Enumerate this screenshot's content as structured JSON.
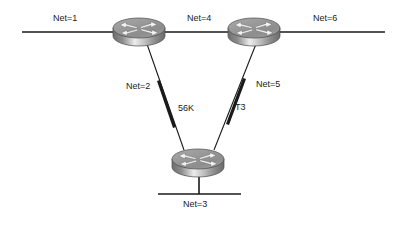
{
  "diagram": {
    "background_color": "#ffffff",
    "line_color": "#1a1a1a",
    "router_body_color": "#8e8e8e",
    "router_top_color": "#b5b5b5",
    "router_arrow_color": "#f2f2f2",
    "nodes": [
      {
        "id": "router-top-left",
        "name": "router-top-left",
        "icon": "router-icon",
        "x": 139,
        "y": 31
      },
      {
        "id": "router-top-right",
        "name": "router-top-right",
        "icon": "router-icon",
        "x": 254,
        "y": 31
      },
      {
        "id": "router-bottom",
        "name": "router-bottom",
        "icon": "router-icon",
        "x": 198,
        "y": 162
      }
    ],
    "links": [
      {
        "id": "link-net1",
        "name": "segment-net-1",
        "type": "bus",
        "label": "Net=1"
      },
      {
        "id": "link-net4",
        "name": "segment-net-4",
        "type": "bus",
        "label": "Net=4"
      },
      {
        "id": "link-net6",
        "name": "segment-net-6",
        "type": "bus",
        "label": "Net=6"
      },
      {
        "id": "link-net2",
        "name": "serial-link-net-2",
        "type": "serial",
        "label": "Net=2",
        "speed": "56K"
      },
      {
        "id": "link-net5",
        "name": "serial-link-net-5",
        "type": "serial",
        "label": "Net=5",
        "speed": "T3"
      },
      {
        "id": "link-net3",
        "name": "segment-net-3",
        "type": "bus",
        "label": "Net=3"
      }
    ],
    "labels": {
      "net1": "Net=1",
      "net2": "Net=2",
      "net3": "Net=3",
      "net4": "Net=4",
      "net5": "Net=5",
      "net6": "Net=6",
      "speed_56k": "56K",
      "speed_t3": "T3"
    }
  }
}
